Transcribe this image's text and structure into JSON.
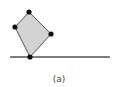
{
  "figure": {
    "caption": "(a)",
    "colors": {
      "fill": "#d3d3d3",
      "stroke": "#555555",
      "vertex": "#111111",
      "ground": "#555555"
    },
    "polygon": {
      "vertices": [
        {
          "name": "top",
          "x": 29,
          "y": 12
        },
        {
          "name": "right",
          "x": 51,
          "y": 34
        },
        {
          "name": "bottom",
          "x": 30,
          "y": 57
        },
        {
          "name": "left",
          "x": 15,
          "y": 27
        }
      ]
    },
    "ground_line": {
      "x1": 10,
      "y1": 57,
      "x2": 110,
      "y2": 57
    }
  }
}
